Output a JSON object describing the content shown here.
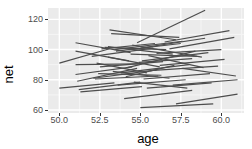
{
  "chart_data": {
    "type": "line",
    "title": "",
    "subtitle": "",
    "xlabel": "age",
    "ylabel": "net",
    "xlim": [
      49.3,
      61.4
    ],
    "ylim": [
      58.0,
      127.5
    ],
    "xticks": [
      50.0,
      52.5,
      55.0,
      57.5,
      60.0
    ],
    "xticklabels": [
      "50.0",
      "52.5",
      "55.0",
      "57.5",
      "60.0"
    ],
    "yticks": [
      60,
      80,
      100,
      120
    ],
    "yticklabels": [
      "60",
      "80",
      "100",
      "120"
    ],
    "grid": true,
    "grid_major_color": "#ffffff",
    "grid_minor_color": "#f5f5f5",
    "panel_background": "#ebebeb",
    "legend": "none",
    "line_color": "#4d4d4d",
    "line_width": 1.2,
    "series_note": "spaghetti plot: one 2-point line segment per subject",
    "series": [
      {
        "name": "s1",
        "x": [
          50.0,
          53.1
        ],
        "y": [
          91.0,
          100.5
        ]
      },
      {
        "name": "s2",
        "x": [
          50.0,
          53.4
        ],
        "y": [
          74.5,
          78.0
        ]
      },
      {
        "name": "s3",
        "x": [
          51.0,
          54.4
        ],
        "y": [
          104.5,
          98.0
        ]
      },
      {
        "name": "s4",
        "x": [
          51.0,
          54.3
        ],
        "y": [
          99.0,
          92.5
        ]
      },
      {
        "name": "s5",
        "x": [
          51.0,
          54.5
        ],
        "y": [
          83.5,
          88.5
        ]
      },
      {
        "name": "s6",
        "x": [
          51.1,
          54.8
        ],
        "y": [
          79.0,
          87.5
        ]
      },
      {
        "name": "s7",
        "x": [
          51.2,
          55.0
        ],
        "y": [
          73.5,
          78.5
        ]
      },
      {
        "name": "s8",
        "x": [
          51.3,
          55.1
        ],
        "y": [
          72.0,
          75.5
        ]
      },
      {
        "name": "s9",
        "x": [
          51.0,
          54.9
        ],
        "y": [
          90.0,
          90.5
        ]
      },
      {
        "name": "s10",
        "x": [
          52.0,
          55.8
        ],
        "y": [
          95.5,
          101.0
        ]
      },
      {
        "name": "s11",
        "x": [
          52.1,
          56.0
        ],
        "y": [
          81.0,
          86.5
        ]
      },
      {
        "name": "s12",
        "x": [
          52.2,
          56.1
        ],
        "y": [
          80.5,
          82.5
        ]
      },
      {
        "name": "s13",
        "x": [
          52.4,
          56.3
        ],
        "y": [
          84.0,
          83.0
        ]
      },
      {
        "name": "s14",
        "x": [
          52.5,
          56.4
        ],
        "y": [
          88.5,
          92.0
        ]
      },
      {
        "name": "s15",
        "x": [
          52.8,
          56.6
        ],
        "y": [
          101.5,
          100.0
        ]
      },
      {
        "name": "s16",
        "x": [
          53.0,
          57.0
        ],
        "y": [
          102.0,
          97.0
        ]
      },
      {
        "name": "s17",
        "x": [
          53.1,
          57.2
        ],
        "y": [
          113.0,
          106.5
        ]
      },
      {
        "name": "s18",
        "x": [
          53.2,
          57.4
        ],
        "y": [
          110.5,
          108.0
        ]
      },
      {
        "name": "s19",
        "x": [
          53.4,
          57.6
        ],
        "y": [
          100.0,
          105.5
        ]
      },
      {
        "name": "s20",
        "x": [
          53.5,
          57.5
        ],
        "y": [
          99.0,
          104.0
        ]
      },
      {
        "name": "s21",
        "x": [
          53.6,
          57.8
        ],
        "y": [
          76.5,
          80.0
        ]
      },
      {
        "name": "s22",
        "x": [
          53.8,
          58.0
        ],
        "y": [
          84.5,
          90.0
        ]
      },
      {
        "name": "s23",
        "x": [
          54.0,
          58.2
        ],
        "y": [
          67.5,
          73.0
        ]
      },
      {
        "name": "s24",
        "x": [
          54.2,
          58.4
        ],
        "y": [
          88.0,
          99.0
        ]
      },
      {
        "name": "s25",
        "x": [
          54.4,
          58.5
        ],
        "y": [
          97.0,
          95.5
        ]
      },
      {
        "name": "s26",
        "x": [
          54.5,
          58.8
        ],
        "y": [
          103.0,
          95.0
        ]
      },
      {
        "name": "s27",
        "x": [
          54.8,
          59.0
        ],
        "y": [
          104.5,
          126.0
        ]
      },
      {
        "name": "s28",
        "x": [
          55.0,
          59.0
        ],
        "y": [
          101.0,
          107.5
        ]
      },
      {
        "name": "s29",
        "x": [
          55.1,
          59.2
        ],
        "y": [
          92.5,
          98.0
        ]
      },
      {
        "name": "s30",
        "x": [
          55.2,
          59.3
        ],
        "y": [
          80.5,
          84.0
        ]
      },
      {
        "name": "s31",
        "x": [
          55.4,
          59.4
        ],
        "y": [
          74.5,
          78.0
        ]
      },
      {
        "name": "s32",
        "x": [
          55.0,
          59.5
        ],
        "y": [
          61.5,
          64.0
        ]
      },
      {
        "name": "s33",
        "x": [
          55.6,
          59.8
        ],
        "y": [
          86.0,
          89.0
        ]
      },
      {
        "name": "s34",
        "x": [
          56.0,
          60.0
        ],
        "y": [
          97.5,
          100.0
        ]
      },
      {
        "name": "s35",
        "x": [
          56.2,
          60.2
        ],
        "y": [
          89.5,
          93.5
        ]
      },
      {
        "name": "s36",
        "x": [
          56.5,
          60.5
        ],
        "y": [
          105.0,
          112.5
        ]
      },
      {
        "name": "s37",
        "x": [
          56.8,
          60.8
        ],
        "y": [
          100.5,
          108.0
        ]
      },
      {
        "name": "s38",
        "x": [
          57.0,
          61.0
        ],
        "y": [
          76.5,
          80.0
        ]
      },
      {
        "name": "s39",
        "x": [
          57.2,
          61.0
        ],
        "y": [
          64.0,
          70.5
        ]
      },
      {
        "name": "s40",
        "x": [
          57.6,
          60.9
        ],
        "y": [
          87.5,
          82.5
        ]
      },
      {
        "name": "s41",
        "x": [
          54.9,
          58.2
        ],
        "y": [
          91.5,
          94.0
        ]
      },
      {
        "name": "s42",
        "x": [
          53.0,
          56.2
        ],
        "y": [
          95.0,
          88.5
        ]
      },
      {
        "name": "s43",
        "x": [
          52.3,
          55.4
        ],
        "y": [
          91.0,
          84.5
        ]
      },
      {
        "name": "s44",
        "x": [
          54.1,
          57.1
        ],
        "y": [
          82.0,
          89.5
        ]
      },
      {
        "name": "s45",
        "x": [
          53.3,
          56.8
        ],
        "y": [
          85.5,
          81.0
        ]
      },
      {
        "name": "s46",
        "x": [
          55.5,
          58.9
        ],
        "y": [
          96.0,
          88.0
        ]
      },
      {
        "name": "s47",
        "x": [
          52.6,
          55.9
        ],
        "y": [
          100.5,
          104.0
        ]
      },
      {
        "name": "s48",
        "x": [
          54.6,
          57.9
        ],
        "y": [
          78.5,
          74.5
        ]
      }
    ]
  }
}
